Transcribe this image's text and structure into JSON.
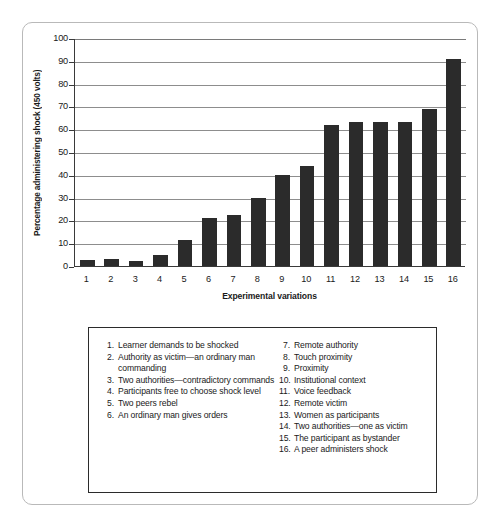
{
  "chart_data": {
    "type": "bar",
    "title": "",
    "xlabel": "Experimental variations",
    "ylabel": "Percentage administering shock (450 volts)",
    "categories": [
      "1",
      "2",
      "3",
      "4",
      "5",
      "6",
      "7",
      "8",
      "9",
      "10",
      "11",
      "12",
      "13",
      "14",
      "15",
      "16"
    ],
    "values": [
      2.5,
      3,
      2,
      5,
      11.5,
      21,
      22.5,
      30,
      40,
      44,
      62,
      63,
      63,
      63,
      69,
      91
    ],
    "ylim": [
      0,
      100
    ],
    "ytick_labels": [
      "0",
      "10",
      "20",
      "30",
      "40",
      "50",
      "60",
      "70",
      "80",
      "90",
      "100"
    ],
    "ytick_values": [
      0,
      10,
      20,
      30,
      40,
      50,
      60,
      70,
      80,
      90,
      100
    ],
    "grid": true,
    "legend_position": "below-plot",
    "bar_color": "#2b2b2b",
    "gridline_color": "#8d8d8d",
    "axis_color": "#3a3a3a"
  },
  "legend": {
    "left_column": [
      {
        "num": "1.",
        "text": "Learner demands to be shocked"
      },
      {
        "num": "2.",
        "text": "Authority as victim—an ordinary man commanding"
      },
      {
        "num": "3.",
        "text": "Two authorities—contradictory commands"
      },
      {
        "num": "4.",
        "text": "Participants free to choose shock level"
      },
      {
        "num": "5.",
        "text": "Two peers rebel"
      },
      {
        "num": "6.",
        "text": "An ordinary man gives orders"
      }
    ],
    "right_column": [
      {
        "num": "7.",
        "text": "Remote authority"
      },
      {
        "num": "8.",
        "text": "Touch proximity"
      },
      {
        "num": "9.",
        "text": "Proximity"
      },
      {
        "num": "10.",
        "text": "Institutional context"
      },
      {
        "num": "11.",
        "text": "Voice feedback"
      },
      {
        "num": "12.",
        "text": "Remote victim"
      },
      {
        "num": "13.",
        "text": "Women as participants"
      },
      {
        "num": "14.",
        "text": "Two authorities—one as victim"
      },
      {
        "num": "15.",
        "text": "The participant as bystander"
      },
      {
        "num": "16.",
        "text": "A peer administers shock"
      }
    ]
  }
}
